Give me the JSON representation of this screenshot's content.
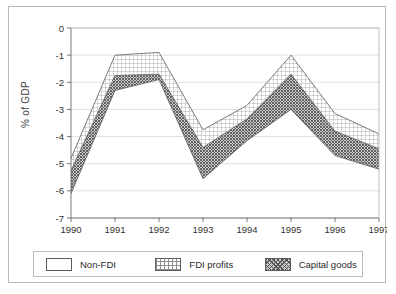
{
  "chart_data": {
    "type": "area",
    "title": "",
    "xlabel": "",
    "ylabel": "% of GDP",
    "categories": [
      "1990",
      "1991",
      "1992",
      "1993",
      "1994",
      "1995",
      "1996",
      "1997"
    ],
    "x": [
      1990,
      1991,
      1992,
      1993,
      1994,
      1995,
      1996,
      1997
    ],
    "ylim": [
      -7,
      0
    ],
    "yticks": [
      "0",
      "-1",
      "-2",
      "-3",
      "-4",
      "-5",
      "-6",
      "-7"
    ],
    "ytick_values": [
      0,
      -1,
      -2,
      -3,
      -4,
      -5,
      -6,
      -7
    ],
    "grid": true,
    "stacked": true,
    "stack_direction": "negative",
    "legend_position": "bottom",
    "series": [
      {
        "name": "Non-FDI",
        "fill": "white",
        "values": [
          -4.8,
          -1.0,
          -0.9,
          -3.75,
          -2.85,
          -1.0,
          -3.15,
          -3.9
        ],
        "note": "outermost boundary (cumulative top edge of stack)"
      },
      {
        "name": "FDI profits",
        "fill": "grid-hatch",
        "values": [
          -5.25,
          -1.75,
          -1.7,
          -4.4,
          -3.35,
          -1.7,
          -3.8,
          -4.45
        ],
        "note": "middle boundary (cumulative)"
      },
      {
        "name": "Capital goods",
        "fill": "dark-crosshatch",
        "values": [
          -6.1,
          -2.3,
          -1.9,
          -5.55,
          -4.15,
          -3.0,
          -4.7,
          -5.2
        ],
        "note": "innermost boundary (cumulative bottom edge of stack)"
      }
    ],
    "cumulative_boundaries": {
      "top": [
        -4.8,
        -1.0,
        -0.9,
        -3.75,
        -2.85,
        -1.0,
        -3.15,
        -3.9
      ],
      "middle": [
        -5.25,
        -1.75,
        -1.7,
        -4.4,
        -3.35,
        -1.7,
        -3.8,
        -4.45
      ],
      "bottom": [
        -6.1,
        -2.3,
        -1.9,
        -5.55,
        -4.15,
        -3.0,
        -4.7,
        -5.2
      ]
    },
    "colors": {
      "line": "#5d5d5d",
      "grid": "#d3d3d3",
      "axis": "#6a6a6a",
      "frame": "#b9b9b9",
      "capital_goods_fill": "#9a9a9a",
      "fdi_profits_fill": "#dcdcdc",
      "non_fdi_fill": "#ffffff"
    }
  },
  "legend": {
    "items": [
      {
        "label": "Non-FDI",
        "swatch": "white-swatch"
      },
      {
        "label": "FDI profits",
        "swatch": "grid-hatch-swatch"
      },
      {
        "label": "Capital goods",
        "swatch": "dark-crosshatch-swatch"
      }
    ]
  }
}
